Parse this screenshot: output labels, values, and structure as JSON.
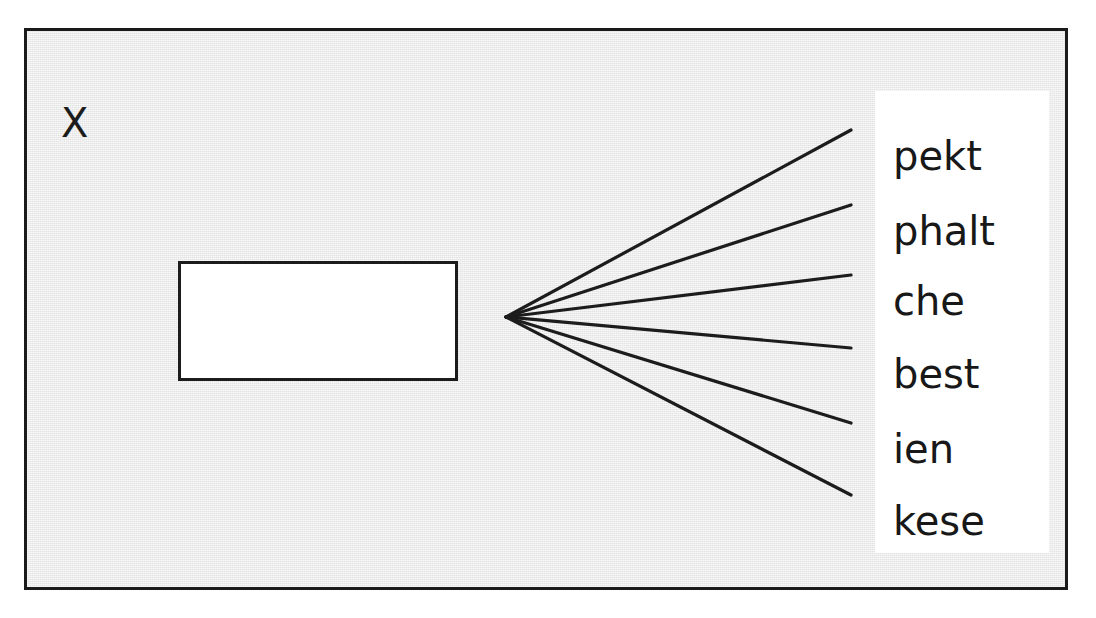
{
  "figure": {
    "panel_marker": "X",
    "background_color": "#e3e3e3",
    "ink_color": "#1c1c1c",
    "panel_color": "#ffffff"
  },
  "diagram": {
    "type": "leader-line-callout",
    "node": {
      "name": "empty-box",
      "label": "",
      "fill": "#ffffff",
      "stroke": "#1c1c1c"
    },
    "fan_origin": {
      "x": 503,
      "y": 314
    },
    "labels": [
      {
        "text": "pekt",
        "line_end_y": 127
      },
      {
        "text": "phalt",
        "line_end_y": 202
      },
      {
        "text": "che",
        "line_end_y": 272
      },
      {
        "text": "best",
        "line_end_y": 345
      },
      {
        "text": "ien",
        "line_end_y": 420
      },
      {
        "text": "kese",
        "line_end_y": 492
      }
    ]
  }
}
